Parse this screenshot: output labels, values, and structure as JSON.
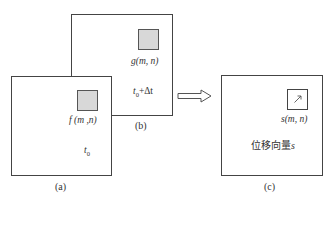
{
  "diagram": {
    "panel_b": {
      "caption": "(b)",
      "patch_label": "g(m, n)",
      "time_label": "t0+Δt",
      "time_base": "t",
      "time_sub": "0",
      "time_suffix": "+Δt"
    },
    "panel_a": {
      "caption": "(a)",
      "patch_label": "f (m ,n)",
      "time_base": "t",
      "time_sub": "0"
    },
    "panel_c": {
      "caption": "(c)",
      "patch_label": "s(m, n)",
      "vector_text": "位移向量",
      "vector_symbol": "s"
    },
    "arrow": {
      "direction": "right",
      "style": "hollow-double"
    },
    "colors": {
      "stroke": "#444444",
      "patch_fill": "#d8d8d8",
      "background": "#ffffff"
    }
  }
}
